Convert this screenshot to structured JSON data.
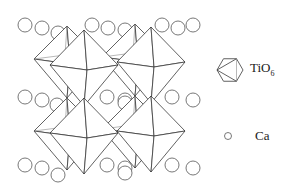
{
  "legend": {
    "octahedron": {
      "label": "TiO",
      "subscript": "6",
      "icon": "octahedron-icon"
    },
    "calcium": {
      "label": "Ca",
      "icon": "circle-icon"
    }
  },
  "colors": {
    "line": "#3a3a3a",
    "circle_stroke": "#555555",
    "background": "#ffffff"
  },
  "structure": {
    "octahedra_layers": 2,
    "octahedra_per_layer_front": 2,
    "ca_rows": 3
  }
}
